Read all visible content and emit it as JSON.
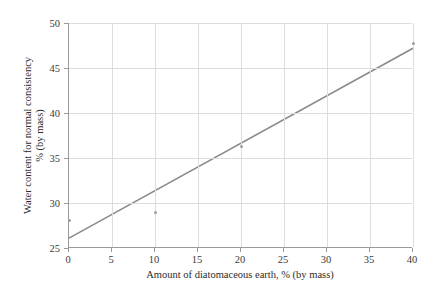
{
  "chart_data": {
    "type": "scatter",
    "title": "",
    "subtitle": "",
    "xlabel": "Amount of diatomaceous earth, % (by mass)",
    "ylabel_line1": "Water content for normal consistency",
    "ylabel_line2": "% (by mass)",
    "xlim": [
      0,
      40
    ],
    "ylim": [
      25,
      50
    ],
    "xticks": [
      0,
      5,
      10,
      15,
      20,
      25,
      30,
      35,
      40
    ],
    "yticks": [
      25,
      30,
      35,
      40,
      45,
      50
    ],
    "xticklabels": [
      "0",
      "5",
      "10",
      "15",
      "20",
      "25",
      "30",
      "35",
      "40"
    ],
    "yticklabels": [
      "25",
      "30",
      "35",
      "40",
      "45",
      "50"
    ],
    "grid": "both",
    "legend": "none",
    "points": [
      {
        "x": 0,
        "y": 28.1
      },
      {
        "x": 10,
        "y": 29.0
      },
      {
        "x": 20,
        "y": 36.3
      },
      {
        "x": 40,
        "y": 47.7
      }
    ],
    "trendline": {
      "name": "linear fit",
      "x_start": 0,
      "y_start": 26.1,
      "x_end": 40,
      "y_end": 47.2,
      "color": "#8a8a8a",
      "width": 1.6
    },
    "colors": {
      "point": "#9d9d9d",
      "line": "#8a8a8a",
      "grid": "#dddddd",
      "axis": "#9a9a9a",
      "text": "#2b2b2b",
      "background": "#ffffff"
    }
  }
}
